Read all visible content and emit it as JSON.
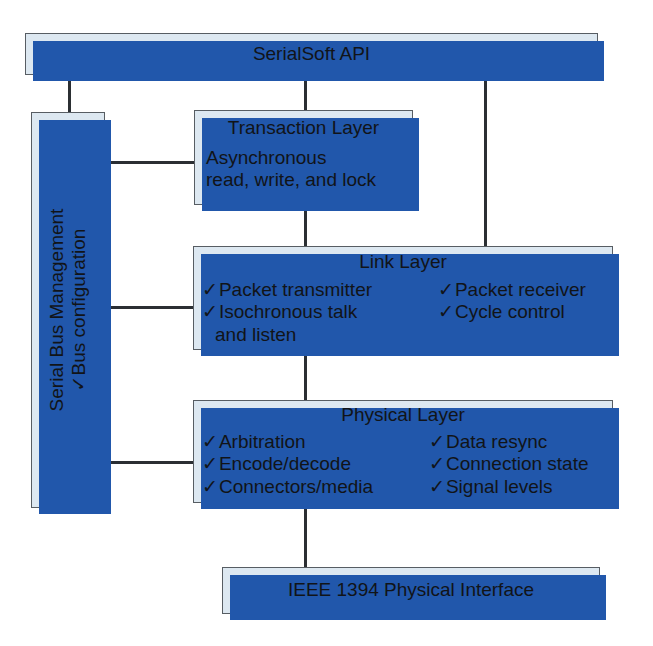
{
  "diagram": {
    "colors": {
      "box_fill": "#dde8f1",
      "box_border": "#575d63",
      "shadow_blue": "#2157ab",
      "connector": "#2b2f33",
      "text": "#111418"
    },
    "check_glyph": "✓"
  },
  "api_box": {
    "label": "SerialSoft API"
  },
  "serial_bus_management": {
    "title": "Serial Bus Management",
    "items": [
      {
        "check": "✓",
        "label": "Bus configuration"
      }
    ]
  },
  "transaction_layer": {
    "title": "Transaction Layer",
    "body_lines": [
      "Asynchronous",
      "read, write, and lock"
    ]
  },
  "link_layer": {
    "title": "Link Layer",
    "left_items": [
      {
        "check": "✓",
        "label": "Packet transmitter",
        "cont": null
      },
      {
        "check": "✓",
        "label": "Isochronous talk",
        "cont": "and listen"
      }
    ],
    "right_items": [
      {
        "check": "✓",
        "label": "Packet receiver"
      },
      {
        "check": "✓",
        "label": "Cycle control"
      }
    ]
  },
  "physical_layer": {
    "title": "Physical Layer",
    "left_items": [
      {
        "check": "✓",
        "label": "Arbitration"
      },
      {
        "check": "✓",
        "label": "Encode/decode"
      },
      {
        "check": "✓",
        "label": "Connectors/media"
      }
    ],
    "right_items": [
      {
        "check": "✓",
        "label": "Data resync"
      },
      {
        "check": "✓",
        "label": "Connection state"
      },
      {
        "check": "✓",
        "label": "Signal levels"
      }
    ]
  },
  "interface_box": {
    "label": "IEEE 1394 Physical Interface"
  }
}
